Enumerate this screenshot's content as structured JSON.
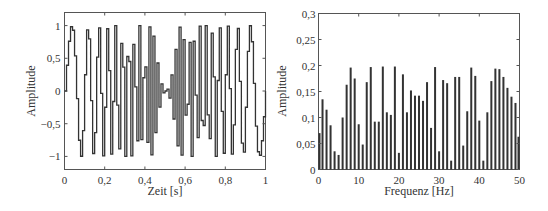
{
  "chart_data": [
    {
      "type": "line",
      "title": "",
      "xlabel": "Zeit [s]",
      "ylabel": "Amplitude",
      "xlim": [
        0,
        1
      ],
      "ylim": [
        -1.2,
        1.2
      ],
      "xticks": [
        0,
        0.2,
        0.4,
        0.6,
        0.8,
        1
      ],
      "xtick_labels": [
        "0",
        "0,2",
        "0,4",
        "0,6",
        "0,8",
        "1"
      ],
      "yticks": [
        -1,
        -0.5,
        0,
        0.5,
        1
      ],
      "ytick_labels": [
        "−1",
        "−0,5",
        "0",
        "0,5",
        "1"
      ],
      "grid": false,
      "description": "Sample-and-hold (stair-step) chirp signal, frequency rising toward t=0.5 s then falling symmetrically, sampled at 100 Hz",
      "signal": {
        "sample_rate_hz": 100,
        "duration_s": 1,
        "style": "step",
        "f_start_hz": 6,
        "f_mid_hz": 50,
        "symmetric_about_s": 0.5
      },
      "line_color": "#333333"
    },
    {
      "type": "bar",
      "title": "",
      "xlabel": "Frequenz [Hz]",
      "ylabel": "Amplitude",
      "xlim": [
        0,
        50
      ],
      "ylim": [
        0,
        0.3
      ],
      "xticks": [
        0,
        10,
        20,
        30,
        40,
        50
      ],
      "xtick_labels": [
        "0",
        "10",
        "20",
        "30",
        "40",
        "50"
      ],
      "yticks": [
        0,
        0.05,
        0.1,
        0.15,
        0.2,
        0.25,
        0.3
      ],
      "ytick_labels": [
        "0",
        "0,05",
        "0,1",
        "0,15",
        "0,2",
        "0,25",
        "0,3"
      ],
      "grid": false,
      "x": [
        0,
        1,
        2,
        3,
        4,
        5,
        6,
        7,
        8,
        9,
        10,
        11,
        12,
        13,
        14,
        15,
        16,
        17,
        18,
        19,
        20,
        21,
        22,
        23,
        24,
        25,
        26,
        27,
        28,
        29,
        30,
        31,
        32,
        33,
        34,
        35,
        36,
        37,
        38,
        39,
        40,
        41,
        42,
        43,
        44,
        45,
        46,
        47,
        48,
        49,
        50
      ],
      "values": [
        0.07,
        0.135,
        0.115,
        0.085,
        0.035,
        0.028,
        0.1,
        0.163,
        0.196,
        0.175,
        0.087,
        0.048,
        0.168,
        0.197,
        0.092,
        0.092,
        0.198,
        0.11,
        0.105,
        0.198,
        0.032,
        0.183,
        0.11,
        0.152,
        0.142,
        0.142,
        0.132,
        0.168,
        0.08,
        0.197,
        0.035,
        0.172,
        0.166,
        0.017,
        0.178,
        0.178,
        0.046,
        0.112,
        0.196,
        0.18,
        0.094,
        0.017,
        0.11,
        0.17,
        0.194,
        0.193,
        0.178,
        0.157,
        0.14,
        0.128,
        0.063
      ],
      "bar_color": "#333333"
    }
  ]
}
